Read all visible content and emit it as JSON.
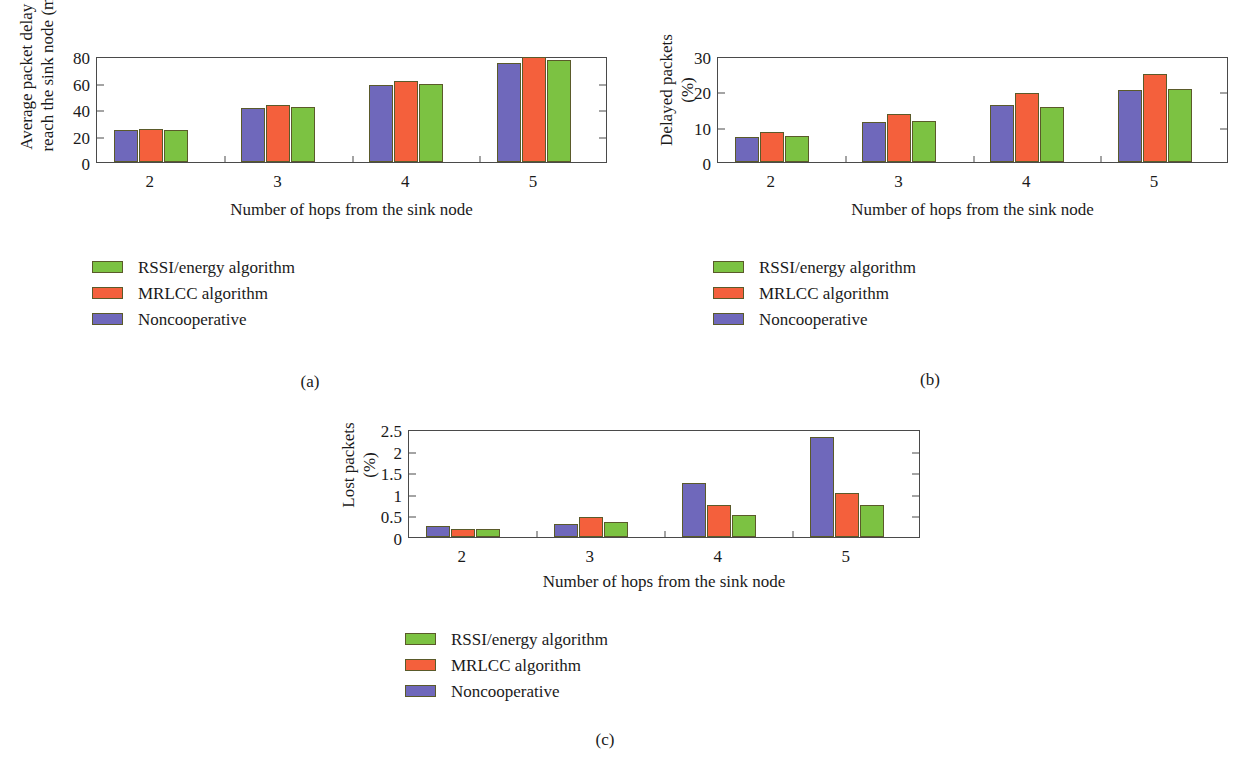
{
  "figure": {
    "series_colors": {
      "rssi": "#7cc242",
      "mrlcc": "#f4603c",
      "noncoop": "#6f68bb"
    },
    "legend": [
      {
        "key": "rssi",
        "label": "RSSI/energy algorithm"
      },
      {
        "key": "mrlcc",
        "label": "MRLCC algorithm"
      },
      {
        "key": "noncoop",
        "label": "Noncooperative"
      }
    ],
    "captions": {
      "a": "(a)",
      "b": "(b)",
      "c": "(c)"
    }
  },
  "chart_data": [
    {
      "id": "a",
      "type": "bar",
      "title": "",
      "xlabel": "Number of hops from the sink node",
      "ylabel": "Average packet delay to reach the sink node (ms)",
      "ylabel_lines": [
        "Average packet delay to",
        "reach the sink node (ms)"
      ],
      "categories": [
        "2",
        "3",
        "4",
        "5"
      ],
      "xtick_labels": [
        "2",
        "3",
        "4",
        "5"
      ],
      "ytick_labels": [
        "0",
        "20",
        "40",
        "60",
        "80"
      ],
      "ytick_values": [
        0,
        20,
        40,
        60,
        80
      ],
      "ylim": [
        0,
        80
      ],
      "grid": false,
      "legend_position": "below-left",
      "series": [
        {
          "name": "Noncooperative",
          "key": "noncoop",
          "values": [
            24.0,
            41.0,
            58.5,
            75.0
          ]
        },
        {
          "name": "MRLCC algorithm",
          "key": "mrlcc",
          "values": [
            25.0,
            43.0,
            61.0,
            79.5
          ]
        },
        {
          "name": "RSSI/energy algorithm",
          "key": "rssi",
          "values": [
            24.5,
            41.5,
            59.0,
            77.0
          ]
        }
      ]
    },
    {
      "id": "b",
      "type": "bar",
      "title": "",
      "xlabel": "Number of hops from the sink node",
      "ylabel": "Delayed packets (%)",
      "ylabel_lines": [
        "Delayed packets",
        "(%)"
      ],
      "categories": [
        "2",
        "3",
        "4",
        "5"
      ],
      "xtick_labels": [
        "2",
        "3",
        "4",
        "5"
      ],
      "ytick_labels": [
        "0",
        "10",
        "20",
        "30"
      ],
      "ytick_values": [
        0,
        10,
        20,
        30
      ],
      "ylim": [
        0,
        30
      ],
      "grid": false,
      "legend_position": "below-left",
      "series": [
        {
          "name": "Noncooperative",
          "key": "noncoop",
          "values": [
            7.0,
            11.3,
            16.1,
            20.5
          ]
        },
        {
          "name": "MRLCC algorithm",
          "key": "mrlcc",
          "values": [
            8.5,
            13.6,
            19.5,
            25.0
          ]
        },
        {
          "name": "RSSI/energy algorithm",
          "key": "rssi",
          "values": [
            7.3,
            11.5,
            15.7,
            20.8
          ]
        }
      ]
    },
    {
      "id": "c",
      "type": "bar",
      "title": "",
      "xlabel": "Number of hops from the sink node",
      "ylabel": "Lost packets (%)",
      "ylabel_lines": [
        "Lost packets",
        "(%)"
      ],
      "categories": [
        "2",
        "3",
        "4",
        "5"
      ],
      "xtick_labels": [
        "2",
        "3",
        "4",
        "5"
      ],
      "ytick_labels": [
        "0",
        "0.5",
        "1",
        "1.5",
        "2",
        "2.5"
      ],
      "ytick_values": [
        0,
        0.5,
        1,
        1.5,
        2,
        2.5
      ],
      "ylim": [
        0,
        2.5
      ],
      "grid": false,
      "legend_position": "below-left",
      "series": [
        {
          "name": "Noncooperative",
          "key": "noncoop",
          "values": [
            0.25,
            0.31,
            1.25,
            2.31
          ]
        },
        {
          "name": "MRLCC algorithm",
          "key": "mrlcc",
          "values": [
            0.18,
            0.47,
            0.75,
            1.01
          ]
        },
        {
          "name": "RSSI/energy algorithm",
          "key": "rssi",
          "values": [
            0.19,
            0.35,
            0.51,
            0.75
          ]
        }
      ]
    }
  ]
}
